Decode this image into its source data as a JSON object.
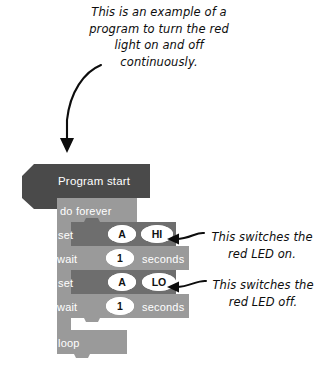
{
  "annotations": {
    "intro": "This is an example of a program to turn the red light on and off continuously.",
    "note_on": "This switches the red LED on.",
    "note_off": "This switches the red LED off.",
    "curved_arrow": "curved-down-arrow-icon",
    "arrow_hi": "left-arrow-icon",
    "arrow_lo": "left-arrow-icon"
  },
  "program": {
    "hat": {
      "label": "Program start"
    },
    "forever": {
      "header": "do forever",
      "footer": "loop"
    },
    "statements": [
      {
        "type": "set",
        "keyword": "set",
        "slots": [
          "A",
          "HI"
        ]
      },
      {
        "type": "wait",
        "keyword": "wait",
        "value": "1",
        "unit": "seconds"
      },
      {
        "type": "set",
        "keyword": "set",
        "slots": [
          "A",
          "LO"
        ]
      },
      {
        "type": "wait",
        "keyword": "wait",
        "value": "1",
        "unit": "seconds"
      }
    ]
  },
  "colors": {
    "hat": "#4a4a4a",
    "forever": "#9a9a9a",
    "set": "#6e6e6e",
    "wait": "#9a9a9a",
    "slot": "#ffffff",
    "text": "#ffffff",
    "ink": "#0d0d0d",
    "page": "#ffffff"
  }
}
